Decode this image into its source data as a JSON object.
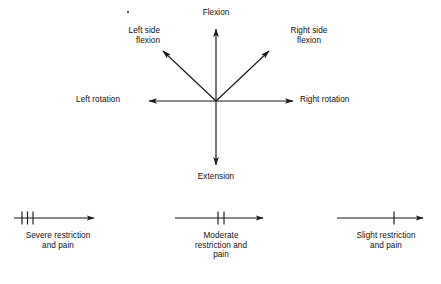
{
  "figure": {
    "ink_color": "#1a1a1a",
    "background_color": "#ffffff"
  },
  "star_diagram": {
    "center": {
      "x": 216,
      "y": 101
    },
    "directions": [
      {
        "id": "flexion",
        "label": "Flexion",
        "angle_deg": 90,
        "tip": {
          "x": 216,
          "y": 26
        },
        "label_align": "center"
      },
      {
        "id": "extension",
        "label": "Extension",
        "angle_deg": 270,
        "tip": {
          "x": 216,
          "y": 168
        },
        "label_align": "center"
      },
      {
        "id": "left-rotation",
        "label": "Left rotation",
        "angle_deg": 180,
        "tip": {
          "x": 146,
          "y": 101
        },
        "label_align": "right"
      },
      {
        "id": "right-rotation",
        "label": "Right rotation",
        "angle_deg": 0,
        "tip": {
          "x": 296,
          "y": 101
        },
        "label_align": "left"
      },
      {
        "id": "left-side-flexion",
        "label": "Left side\nflexion",
        "angle_deg": 136,
        "tip": {
          "x": 160,
          "y": 48
        },
        "label_align": "right"
      },
      {
        "id": "right-side-flexion",
        "label": "Right side\nflexion",
        "angle_deg": 44,
        "tip": {
          "x": 272,
          "y": 48
        },
        "label_align": "center"
      }
    ]
  },
  "scales": [
    {
      "id": "severe",
      "caption": "Severe restriction\nand pain",
      "tick_count": 3,
      "tick_positions_px": [
        22,
        27.5,
        33
      ],
      "line": {
        "x1": 14,
        "x2": 97,
        "y": 218
      },
      "arrow_tip_x": 97,
      "severity": "severe"
    },
    {
      "id": "moderate",
      "caption": "Moderate\nrestriction and\npain",
      "tick_count": 2,
      "tick_positions_px": [
        218,
        224
      ],
      "line": {
        "x1": 175,
        "x2": 266,
        "y": 218
      },
      "arrow_tip_x": 266,
      "severity": "moderate"
    },
    {
      "id": "slight",
      "caption": "Slight restriction\nand pain",
      "tick_count": 1,
      "tick_positions_px": [
        394
      ],
      "line": {
        "x1": 337,
        "x2": 426,
        "y": 218
      },
      "arrow_tip_x": 426,
      "severity": "slight"
    }
  ],
  "artifacts": [
    {
      "id": "scan-speck",
      "x": 128,
      "y": 12,
      "r": 1.2
    }
  ]
}
